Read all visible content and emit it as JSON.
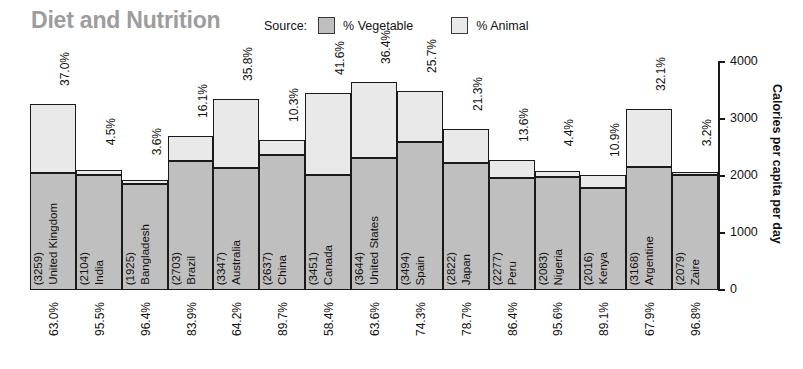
{
  "header": {
    "title": "Diet and Nutrition",
    "title_color": "#9d9d9d",
    "legend": {
      "source_label": "Source:",
      "items": [
        {
          "label": "% Vegetable",
          "color": "#bfbfbf"
        },
        {
          "label": "% Animal",
          "color": "#e9e9e9"
        }
      ]
    }
  },
  "chart_data": {
    "type": "bar",
    "stacked": true,
    "title": "Diet and Nutrition",
    "xlabel": "",
    "ylabel": "Calories per capita per day",
    "ylim": [
      0,
      4000
    ],
    "yticks": [
      0,
      1000,
      2000,
      3000,
      4000
    ],
    "ytick_labels": [
      "0",
      "1000",
      "2000",
      "3000",
      "4000"
    ],
    "grid": false,
    "legend_position": "top-right",
    "categories": [
      "United Kingdom",
      "India",
      "Bangladesh",
      "Brazil",
      "Australia",
      "China",
      "Canada",
      "United States",
      "Spain",
      "Japan",
      "Peru",
      "Nigeria",
      "Kenya",
      "Argentine",
      "Zaire"
    ],
    "totals": [
      3259,
      2104,
      1925,
      2703,
      3347,
      2637,
      3451,
      3644,
      3494,
      2822,
      2277,
      2083,
      2016,
      3168,
      2079
    ],
    "total_labels": [
      "(3259)",
      "(2104)",
      "(1925)",
      "(2703)",
      "(3347)",
      "(2637)",
      "(3451)",
      "(3644)",
      "(3494)",
      "(2822)",
      "(2277)",
      "(2083)",
      "(2016)",
      "(3168)",
      "(2079)"
    ],
    "series": [
      {
        "name": "% Vegetable",
        "color": "#bfbfbf",
        "label_position": "below-axis",
        "values": [
          63.0,
          95.5,
          96.4,
          83.9,
          64.2,
          89.7,
          58.4,
          63.6,
          74.3,
          78.7,
          86.4,
          95.6,
          89.1,
          67.9,
          96.8
        ],
        "labels": [
          "63.0%",
          "95.5%",
          "96.4%",
          "83.9%",
          "64.2%",
          "89.7%",
          "58.4%",
          "63.6%",
          "74.3%",
          "78.7%",
          "86.4%",
          "95.6%",
          "89.1%",
          "67.9%",
          "96.8%"
        ]
      },
      {
        "name": "% Animal",
        "color": "#e9e9e9",
        "label_position": "above-bar",
        "values": [
          37.0,
          4.5,
          3.6,
          16.1,
          35.8,
          10.3,
          41.6,
          36.4,
          25.7,
          21.3,
          13.6,
          4.4,
          10.9,
          32.1,
          3.2
        ],
        "labels": [
          "37.0%",
          "4.5%",
          "3.6%",
          "16.1%",
          "35.8%",
          "10.3%",
          "41.6%",
          "36.4%",
          "25.7%",
          "21.3%",
          "13.6%",
          "4.4%",
          "10.9%",
          "32.1%",
          "3.2%"
        ]
      }
    ]
  }
}
